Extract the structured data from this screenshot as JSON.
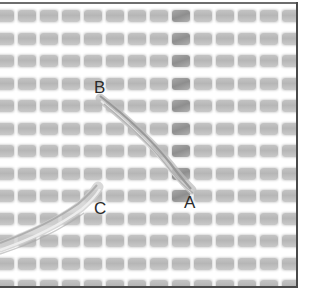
{
  "figure": {
    "grid": {
      "columns": 14,
      "rows": 13,
      "pitch_x": 22,
      "pitch_y": 22.5,
      "hole_color": "#bdbdbd",
      "frame_color": "#4a4a4a"
    },
    "labels": {
      "a": {
        "text": "A",
        "x": 184,
        "y": 194
      },
      "b": {
        "text": "B",
        "x": 94,
        "y": 79
      },
      "c": {
        "text": "C",
        "x": 94,
        "y": 200
      }
    },
    "yarn": {
      "color_light": "#d9d9d9",
      "color_dark": "#9a9a9a",
      "strands": [
        {
          "name": "b-to-a",
          "from": "B",
          "to": "A"
        },
        {
          "name": "left-edge-to-c",
          "from": "left edge",
          "to": "C"
        }
      ]
    }
  }
}
